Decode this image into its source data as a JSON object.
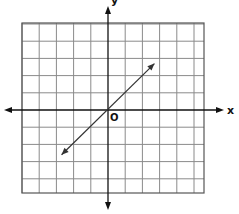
{
  "chart_data": {
    "type": "line",
    "title": "",
    "xlabel": "x",
    "ylabel": "y",
    "origin_label": "O",
    "grid": true,
    "xlim": [
      -5,
      5.7
    ],
    "ylim": [
      -4.8,
      5
    ],
    "axes_arrows": true,
    "series": [
      {
        "name": "y = x",
        "x": [
          -2.7,
          2.7
        ],
        "y": [
          -2.6,
          2.7
        ],
        "arrows_both_ends": true,
        "color": "#333333"
      }
    ]
  }
}
